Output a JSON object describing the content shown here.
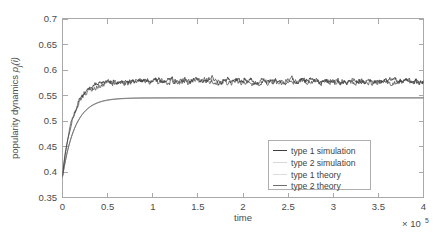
{
  "chart_data": {
    "type": "line",
    "title": "",
    "xlabel": "time",
    "ylabel": "popularity dynamics p_j(i)",
    "x_multiplier": "× 10",
    "x_multiplier_exponent": "5",
    "xlim": [
      0,
      4
    ],
    "ylim": [
      0.35,
      0.7
    ],
    "grid": false,
    "legend_position": "lower right",
    "x_ticks": [
      "0",
      "0.5",
      "1",
      "1.5",
      "2",
      "2.5",
      "3",
      "3.5",
      "4"
    ],
    "x_tick_values": [
      0,
      0.5,
      1,
      1.5,
      2,
      2.5,
      3,
      3.5,
      4
    ],
    "y_ticks": [
      "0.35",
      "0.4",
      "0.45",
      "0.5",
      "0.55",
      "0.6",
      "0.65",
      "0.7"
    ],
    "y_tick_values": [
      0.35,
      0.4,
      0.45,
      0.5,
      0.55,
      0.6,
      0.65,
      0.7
    ],
    "series": [
      {
        "name": "type 1 simulation",
        "color": "#404040",
        "style": "noisy-line",
        "steady_state": 0.578,
        "noise_amplitude": 0.006,
        "initial_value": 0.392,
        "rise_time": 0.12
      },
      {
        "name": "type 2 simulation",
        "color": "#595959",
        "style": "noisy-line",
        "steady_state": 0.576,
        "noise_amplitude": 0.006,
        "initial_value": 0.395,
        "rise_time": 0.12
      },
      {
        "name": "type 1 theory",
        "color": "#6f6f6f",
        "style": "smooth-line",
        "steady_state": 0.545,
        "initial_value": 0.39,
        "rise_time": 0.14
      },
      {
        "name": "type 2 theory",
        "color": "#8a8a8a",
        "style": "smooth-line",
        "steady_state": 0.5445,
        "initial_value": 0.39,
        "rise_time": 0.14
      }
    ]
  },
  "legend": {
    "items": [
      {
        "label": "type 1 simulation"
      },
      {
        "label": "type 2 simulation"
      },
      {
        "label": "type 1 theory"
      },
      {
        "label": "type 2 theory"
      }
    ]
  },
  "axis": {
    "y_label_text": "popularity dynamics ",
    "y_label_symbol": "p",
    "y_label_sub": "j",
    "y_label_arg": "(i)",
    "x_label_text": "time"
  }
}
